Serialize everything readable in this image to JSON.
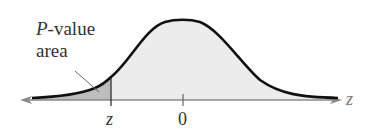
{
  "diagram": {
    "type": "normal-distribution-left-tail",
    "annotation": {
      "line1_italic": "P",
      "line1_rest": "-value",
      "line2": "area"
    },
    "axis": {
      "variable_label": "z",
      "ticks": [
        {
          "label": "z",
          "italic": true
        },
        {
          "label": "0",
          "italic": false
        }
      ]
    },
    "colors": {
      "curve": "#111111",
      "axis": "#888888",
      "tail_fill": "#bdbdbd",
      "body_fill": "#ececec",
      "text": "#333333"
    }
  }
}
